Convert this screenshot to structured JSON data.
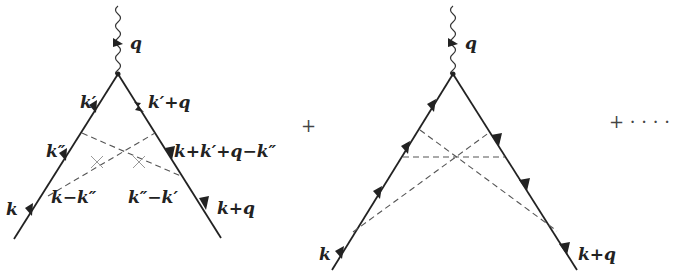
{
  "diagrams": [
    {
      "name": "crossed-vertex-correction",
      "labels": {
        "photon": "q",
        "upper_left": "k′",
        "upper_right": "k′+q",
        "mid_left": "k″",
        "mid_right": "k+k′+q−k″",
        "lower_left_inner": "k−k″",
        "lower_right_inner": "k″−k′",
        "incoming": "k",
        "outgoing": "k+q"
      }
    },
    {
      "name": "higher-order-crossed-vertex",
      "labels": {
        "photon": "q",
        "incoming": "k",
        "outgoing": "k+q"
      }
    }
  ],
  "operators": {
    "plus": "+",
    "plus_ellipsis": "+ · · · ·"
  }
}
